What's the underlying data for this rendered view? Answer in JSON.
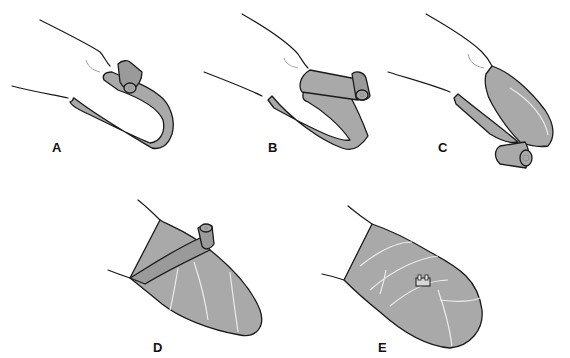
{
  "figure": {
    "panels": [
      {
        "id": "A",
        "label": "A",
        "description": "Bandage roll begins at fingertip, strip laid along finger"
      },
      {
        "id": "B",
        "label": "B",
        "description": "Bandage folded back over fingertip with roll at base"
      },
      {
        "id": "C",
        "label": "C",
        "description": "Bandage laid back down length of finger, roll unrolling below"
      },
      {
        "id": "D",
        "label": "D",
        "description": "Spiral wraps applied around finger, roll at top"
      },
      {
        "id": "E",
        "label": "E",
        "description": "Completed bandage secured with clip"
      }
    ],
    "colors": {
      "bandage": "#a9a9a9",
      "outline": "#1a1a1a",
      "background": "#ffffff"
    }
  }
}
